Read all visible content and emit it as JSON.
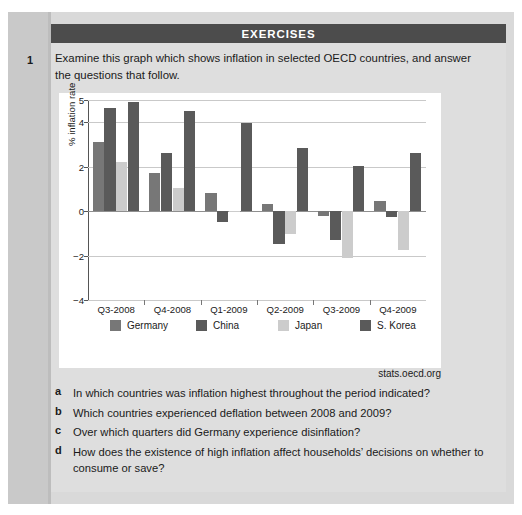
{
  "header": {
    "title": "EXERCISES"
  },
  "exercise": {
    "number": "1",
    "stem": "Examine this graph which shows inflation in selected OECD countries,  and answer the questions that follow."
  },
  "source": {
    "text": "stats.oecd.org"
  },
  "questions": [
    {
      "letter": "a",
      "text": "In which countries was inflation highest throughout the period indicated?"
    },
    {
      "letter": "b",
      "text": "Which countries experienced deflation between 2008 and 2009?"
    },
    {
      "letter": "c",
      "text": "Over which quarters did Germany experience disinflation?"
    },
    {
      "letter": "d",
      "text": "How does the existence of high inflation affect households’ decisions on whether to consume or save?"
    }
  ],
  "chart_data": {
    "type": "bar",
    "title": "",
    "xlabel": "",
    "ylabel": "% inflation rate",
    "ylim": [
      -4,
      5
    ],
    "yticks": [
      5,
      4,
      2,
      0,
      -2,
      -4
    ],
    "ytick_labels": [
      "5",
      "4",
      "2",
      "0",
      "−2",
      "−4"
    ],
    "grid": true,
    "legend_position": "bottom",
    "categories": [
      "Q3-2008",
      "Q4-2008",
      "Q1-2009",
      "Q2-2009",
      "Q3-2009",
      "Q4-2009"
    ],
    "series": [
      {
        "name": "Germany",
        "color": "#777777",
        "values": [
          3.1,
          1.7,
          0.8,
          0.3,
          -0.2,
          0.45
        ]
      },
      {
        "name": "China",
        "color": "#5a5a5a",
        "values": [
          4.65,
          2.6,
          -0.5,
          -1.5,
          -1.3,
          -0.25
        ]
      },
      {
        "name": "Japan",
        "color": "#cccccc",
        "values": [
          2.2,
          1.05,
          0.02,
          -1.05,
          -2.1,
          -1.75
        ]
      },
      {
        "name": "S. Korea",
        "color": "#5a5a5a",
        "values": [
          4.9,
          4.5,
          3.95,
          2.85,
          2.05,
          2.6
        ]
      }
    ]
  },
  "colors": {
    "header_bar": "#4c4c4c",
    "page": "#dedede",
    "chart_card": "#ffffff"
  }
}
